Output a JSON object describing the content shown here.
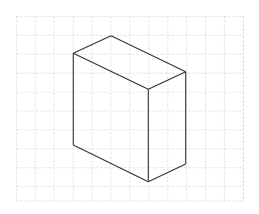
{
  "diagram": {
    "type": "isometric-box",
    "grid": {
      "x0": 16.5,
      "y0": 16.5,
      "x1": 243.5,
      "y1": 201,
      "spacing": 18.9,
      "color": "#d4d4d4"
    },
    "box": {
      "stroke": "#333333",
      "vertices": {
        "top_back": [
          111,
          35.7
        ],
        "top_left": [
          73.3,
          53.3
        ],
        "top_right": [
          185.7,
          71.7
        ],
        "front_top": [
          148.3,
          89.3
        ],
        "bottom_left": [
          73.3,
          145
        ],
        "front_bottom": [
          148.3,
          181.7
        ],
        "bottom_right": [
          185.7,
          164
        ]
      }
    }
  }
}
